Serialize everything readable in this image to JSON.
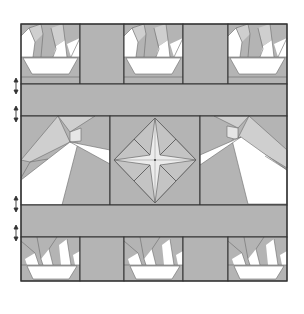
{
  "figure": {
    "colors": {
      "background": "#ffffff",
      "fabric_medium": "#b4b4b4",
      "fabric_light": "#cfcfcf",
      "fabric_white": "#ffffff",
      "star_fill": "#e8e8e8",
      "seam": "#333333",
      "thin_seam": "#6a6a6a"
    },
    "frame": {
      "x": 21,
      "y": 24,
      "w": 266,
      "h": 257
    },
    "rows": [
      {
        "name": "top-row",
        "y": 24,
        "h": 60
      },
      {
        "name": "upper-sashing",
        "y": 84,
        "h": 32
      },
      {
        "name": "middle-row",
        "y": 116,
        "h": 89
      },
      {
        "name": "lower-sashing",
        "y": 205,
        "h": 32
      },
      {
        "name": "bottom-row",
        "y": 237,
        "h": 44
      }
    ],
    "blocks": {
      "top": [
        {
          "type": "basket",
          "x": 21,
          "w": 59
        },
        {
          "type": "sashing",
          "x": 80,
          "w": 44
        },
        {
          "type": "basket",
          "x": 124,
          "w": 59
        },
        {
          "type": "sashing",
          "x": 183,
          "w": 45
        },
        {
          "type": "basket",
          "x": 228,
          "w": 59
        }
      ],
      "middle": [
        {
          "type": "beam-left",
          "x": 21,
          "w": 89
        },
        {
          "type": "compass-star",
          "x": 110,
          "w": 90
        },
        {
          "type": "beam-right",
          "x": 200,
          "w": 87
        }
      ],
      "bottom": [
        {
          "type": "basket",
          "x": 21,
          "w": 59
        },
        {
          "type": "sashing",
          "x": 80,
          "w": 44
        },
        {
          "type": "basket",
          "x": 124,
          "w": 59
        },
        {
          "type": "sashing",
          "x": 183,
          "w": 45
        },
        {
          "type": "basket",
          "x": 228,
          "w": 59
        }
      ]
    },
    "markers": [
      {
        "type": "double-arrow",
        "x": 16,
        "y": 91
      },
      {
        "type": "double-arrow",
        "x": 16,
        "y": 115
      },
      {
        "type": "double-arrow",
        "x": 16,
        "y": 210
      },
      {
        "type": "double-arrow",
        "x": 16,
        "y": 234
      }
    ]
  }
}
